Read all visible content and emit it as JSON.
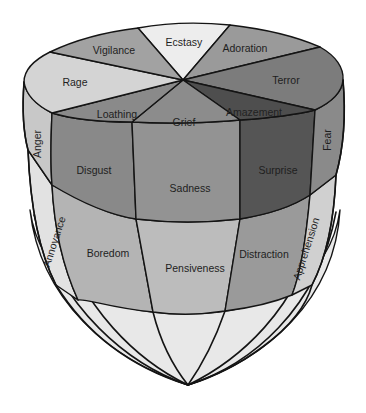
{
  "diagram": {
    "type": "emotion-solid",
    "top_ring": {
      "segments": [
        {
          "label": "Ecstasy",
          "color": "#ededed"
        },
        {
          "label": "Adoration",
          "color": "#9a9a9a"
        },
        {
          "label": "Terror",
          "color": "#7c7c7c"
        },
        {
          "label": "Amazement",
          "color": "#4e4e4e"
        },
        {
          "label": "Grief",
          "color": "#8c8c8c"
        },
        {
          "label": "Loathing",
          "color": "#8a8a8a"
        },
        {
          "label": "Rage",
          "color": "#d4d4d4"
        },
        {
          "label": "Vigilance",
          "color": "#a2a2a2"
        }
      ]
    },
    "middle_band": {
      "segments": [
        {
          "label": "Anger",
          "color": "#c8c8c8"
        },
        {
          "label": "Disgust",
          "color": "#898989"
        },
        {
          "label": "Sadness",
          "color": "#939393"
        },
        {
          "label": "Surprise",
          "color": "#555555"
        },
        {
          "label": "Fear",
          "color": "#8a8a8a"
        }
      ]
    },
    "lower_band": {
      "segments": [
        {
          "label": "Annoyance",
          "color": "#e2e2e2"
        },
        {
          "label": "Boredom",
          "color": "#b4b4b4"
        },
        {
          "label": "Pensiveness",
          "color": "#bcbcbc"
        },
        {
          "label": "Distraction",
          "color": "#9a9a9a"
        },
        {
          "label": "Apprehension",
          "color": "#d0d0d0"
        }
      ]
    },
    "cone_color": "#e6e6e6",
    "outline_color": "#141414"
  }
}
